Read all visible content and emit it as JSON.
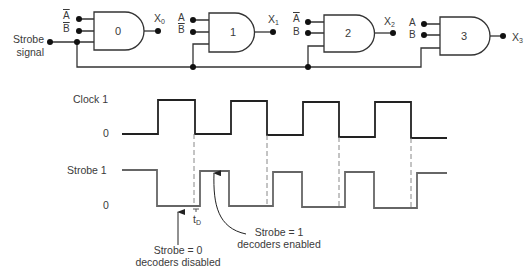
{
  "circuit": {
    "strobe_label_line1": "Strobe",
    "strobe_label_line2": "signal",
    "gates": [
      {
        "number": "0",
        "input_a": "A",
        "input_a_inverted": true,
        "input_b": "B",
        "input_b_inverted": true,
        "output": "X",
        "output_sub": "0"
      },
      {
        "number": "1",
        "input_a": "A",
        "input_a_inverted": false,
        "input_b": "B",
        "input_b_inverted": true,
        "output": "X",
        "output_sub": "1"
      },
      {
        "number": "2",
        "input_a": "A",
        "input_a_inverted": true,
        "input_b": "B",
        "input_b_inverted": false,
        "output": "X",
        "output_sub": "2"
      },
      {
        "number": "3",
        "input_a": "A",
        "input_a_inverted": false,
        "input_b": "B",
        "input_b_inverted": false,
        "output": "X",
        "output_sub": "3"
      }
    ]
  },
  "timing": {
    "clock": {
      "name": "Clock",
      "high": "1",
      "low": "0"
    },
    "strobe": {
      "name": "Strobe",
      "high": "1",
      "low": "0"
    },
    "delay_label": "t",
    "delay_sub": "D",
    "annotation_disabled_line1": "Strobe = 0",
    "annotation_disabled_line2": "decoders disabled",
    "annotation_enabled_line1": "Strobe = 1",
    "annotation_enabled_line2": "decoders enabled"
  },
  "colors": {
    "clock_line": "#222222",
    "strobe_line": "#666666",
    "dashed": "#888888",
    "circuit_line": "#333333"
  }
}
